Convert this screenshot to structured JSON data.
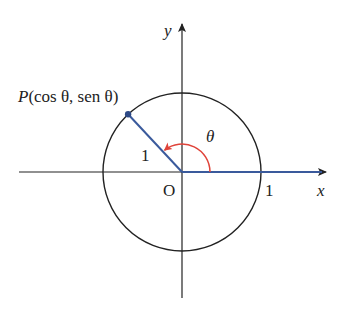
{
  "diagram": {
    "type": "unit-circle",
    "colors": {
      "axis": "#222222",
      "circle": "#222222",
      "radius_segment": "#3a5a9c",
      "angle_arc": "#e0443a",
      "point": "#2e4a86",
      "background": "#ffffff"
    },
    "labels": {
      "x_axis": "x",
      "y_axis": "y",
      "origin": "O",
      "x_intercept": "1",
      "radius": "1",
      "angle": "θ",
      "point_prefix": "P",
      "point_coords": "(cos θ, sen θ)"
    },
    "point_angle_degrees": 133,
    "circle_radius_units": 1
  }
}
